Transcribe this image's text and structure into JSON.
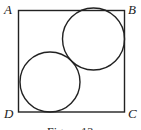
{
  "diagram": {
    "square": {
      "x1": 18,
      "y1": 10,
      "x2": 125,
      "y2": 112
    },
    "vertices": [
      {
        "label": "A",
        "x": 4,
        "y": 14
      },
      {
        "label": "B",
        "x": 128,
        "y": 14
      },
      {
        "label": "C",
        "x": 128,
        "y": 117
      },
      {
        "label": "D",
        "x": 4,
        "y": 117
      }
    ],
    "circles": [
      {
        "name": "upper-right-circle",
        "cx": 94,
        "cy": 39,
        "r": 31
      },
      {
        "name": "lower-left-circle",
        "cx": 50,
        "cy": 82,
        "r": 30
      }
    ],
    "caption": "Figure 13",
    "stroke_color": "#222222"
  }
}
